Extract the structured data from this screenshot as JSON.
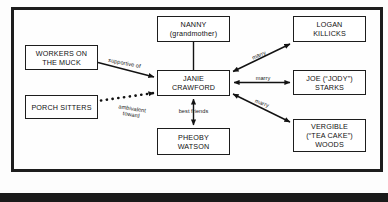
{
  "diagram": {
    "frame_color": "#1d1d1d",
    "background_color": "#fdfdfd",
    "nodes": [
      {
        "id": "nanny",
        "label": "NANNY\n(grandmother)"
      },
      {
        "id": "logan",
        "label": "LOGAN\nKILLICKS"
      },
      {
        "id": "workers",
        "label": "WORKERS ON\nTHE MUCK"
      },
      {
        "id": "janie",
        "label": "JANIE\nCRAWFORD"
      },
      {
        "id": "joe",
        "label": "JOE (“JODY”)\nSTARKS"
      },
      {
        "id": "porch",
        "label": "PORCH SITTERS"
      },
      {
        "id": "vergible",
        "label": "VERGIBLE\n(“TEA CAKE”)\nWOODS"
      },
      {
        "id": "pheoby",
        "label": "PHEOBY\nWATSON"
      }
    ],
    "edges": [
      {
        "id": "workers-janie",
        "from": "workers",
        "to": "janie",
        "label": "supportive of",
        "style": "solid",
        "arrows": "one-way"
      },
      {
        "id": "porch-janie",
        "from": "porch",
        "to": "janie",
        "label": "ambivalent\ntoward",
        "style": "dotted",
        "arrows": "one-way"
      },
      {
        "id": "nanny-janie",
        "from": "nanny",
        "to": "janie",
        "label": "",
        "style": "solid",
        "arrows": "none"
      },
      {
        "id": "janie-logan",
        "from": "janie",
        "to": "logan",
        "label": "marry",
        "style": "solid",
        "arrows": "two-way"
      },
      {
        "id": "janie-joe",
        "from": "janie",
        "to": "joe",
        "label": "marry",
        "style": "solid",
        "arrows": "two-way"
      },
      {
        "id": "janie-vergible",
        "from": "janie",
        "to": "vergible",
        "label": "marry",
        "style": "solid",
        "arrows": "two-way"
      },
      {
        "id": "janie-pheoby",
        "from": "janie",
        "to": "pheoby",
        "label": "best friends",
        "style": "solid",
        "arrows": "two-way"
      }
    ]
  }
}
